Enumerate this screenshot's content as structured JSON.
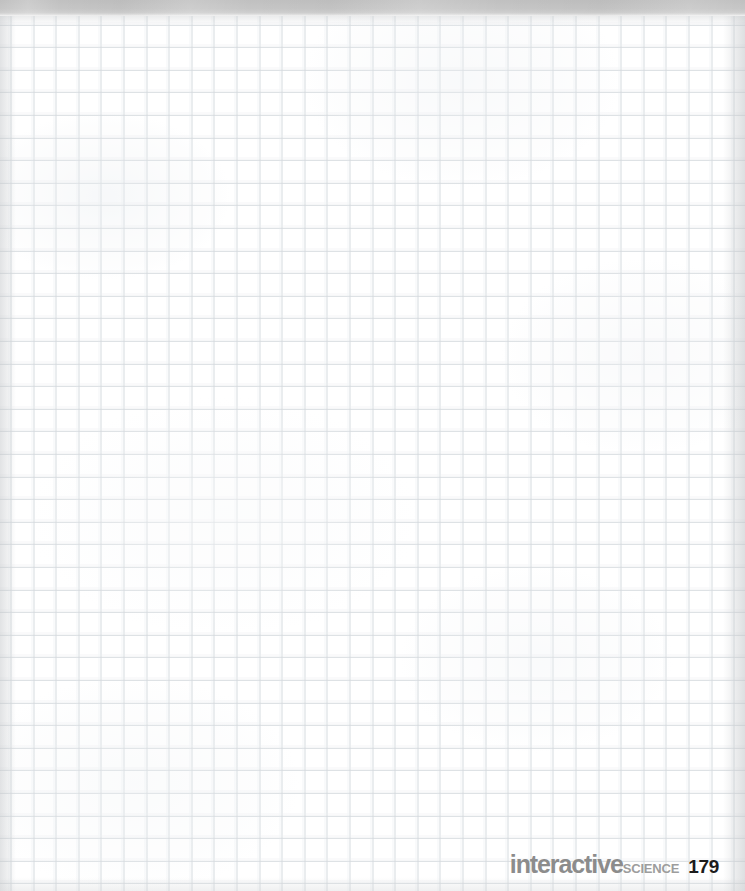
{
  "page": {
    "kind": "blank-grid-worksheet",
    "width": 745,
    "height": 891,
    "background_color": "#ffffff"
  },
  "top_band": {
    "name": "scan-edge-band",
    "color": "#c4c4c4",
    "height_px": 16
  },
  "grid": {
    "name": "graph-paper-grid",
    "line_color": "#d5dade",
    "ghost_line_color": "#e6eaee",
    "cell_size_px": 22.6,
    "origin_x_px": 10.5,
    "origin_y_px": 15.8,
    "columns": 33,
    "rows": 39,
    "content": ""
  },
  "footer": {
    "brand_primary": "interactive",
    "brand_secondary": "SCIENCE",
    "page_number": "179",
    "brand_primary_color": "#8c8c8c",
    "brand_secondary_color": "#9d9d9d",
    "page_number_color": "#1c1c1c"
  }
}
